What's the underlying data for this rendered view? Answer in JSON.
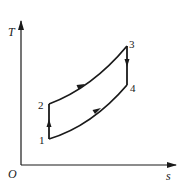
{
  "diagram": {
    "type": "T-s diagram",
    "axes": {
      "y_label": "T",
      "x_label": "s",
      "origin_label": "O"
    },
    "points": [
      {
        "id": "1",
        "label": "1"
      },
      {
        "id": "2",
        "label": "2"
      },
      {
        "id": "3",
        "label": "3"
      },
      {
        "id": "4",
        "label": "4"
      }
    ],
    "processes": [
      {
        "from": "1",
        "to": "2",
        "shape": "vertical line",
        "direction": "up"
      },
      {
        "from": "2",
        "to": "3",
        "shape": "curve",
        "direction": "up-right"
      },
      {
        "from": "3",
        "to": "4",
        "shape": "vertical line",
        "direction": "down"
      },
      {
        "from": "1",
        "to": "4",
        "shape": "curve",
        "direction": "up-right"
      }
    ],
    "colors": {
      "line": "#1a1a1a",
      "background": "#ffffff"
    }
  }
}
